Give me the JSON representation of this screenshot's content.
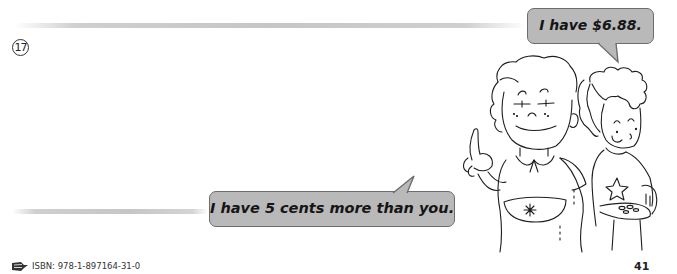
{
  "question": {
    "number": "17",
    "number_display": "17"
  },
  "speech_bubbles": {
    "top": {
      "text": "I have $6.88.",
      "speaker": "girl-pointing"
    },
    "bottom": {
      "text": "I have 5 cents more than you.",
      "speaker": "boy-with-coins"
    }
  },
  "illustration": {
    "description": "Girl in apron with raised index finger, boy holding coins behind her",
    "icons": [
      "girl-character",
      "boy-character",
      "coins",
      "flower-pocket",
      "star-shirt"
    ]
  },
  "footer": {
    "isbn_label": "ISBN: 978-1-897164-31-0",
    "page_number": "41",
    "icon": "book-icon"
  },
  "colors": {
    "bubble_fill": "#b9b9b9",
    "bubble_border": "#6d6d6d",
    "answer_line": "#c6c6c6",
    "ink": "#222222"
  }
}
